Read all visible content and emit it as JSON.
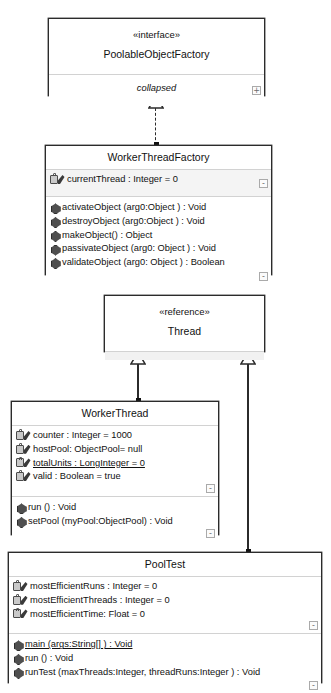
{
  "diagram": {
    "classes": [
      {
        "id": "poolable-object-factory",
        "stereotype": "«interface»",
        "name": "PoolableObjectFactory",
        "collapsed_label": "collapsed",
        "toggle": "+"
      },
      {
        "id": "worker-thread-factory",
        "name": "WorkerThreadFactory",
        "attributes": [
          "currentThread : Integer =  0"
        ],
        "attributes_toggle": "-",
        "operations": [
          "activateObject (arg0:Object  ) : Void",
          "destroyObject (arg0:Object  ) : Void",
          "makeObject() : Object",
          "passivateObject (arg0: Object  ) : Void",
          "validateObject (arg0: Object  ) : Boolean"
        ],
        "operations_toggle": "-"
      },
      {
        "id": "thread",
        "stereotype": "«reference»",
        "name": "Thread"
      },
      {
        "id": "worker-thread",
        "name": "WorkerThread",
        "attributes": [
          "counter : Integer =  1000",
          "hostPool: ObjectPool=  null",
          "totalUnits : LongInteger =  0",
          "valid : Boolean =  true"
        ],
        "attributes_static": [
          false,
          false,
          true,
          false
        ],
        "attributes_toggle": "-",
        "operations": [
          "run () : Void",
          "setPool (myPool:ObjectPool) : Void"
        ],
        "operations_static": [
          false,
          false
        ],
        "operations_toggle": "-"
      },
      {
        "id": "pool-test",
        "name": "PoolTest",
        "attributes": [
          "mostEfficientRuns : Integer =  0",
          "mostEfficientThreads : Integer =  0",
          "mostEfficientTime: Float =  0"
        ],
        "attributes_static": [
          false,
          false,
          false
        ],
        "attributes_toggle": "-",
        "operations": [
          "main (args:String[]  ) : Void",
          "run () : Void",
          "runTest (maxThreads:Integer, threadRuns:Integer ) : Void"
        ],
        "operations_static": [
          true,
          false,
          false
        ],
        "operations_toggle": "-"
      }
    ],
    "relationships": [
      {
        "name": "realization",
        "from": "WorkerThreadFactory",
        "to": "PoolableObjectFactory",
        "line": "dashed",
        "head": "hollow-triangle"
      },
      {
        "name": "generalization",
        "from": "WorkerThread",
        "to": "Thread",
        "line": "solid",
        "head": "hollow-triangle"
      },
      {
        "name": "generalization",
        "from": "PoolTest",
        "to": "Thread",
        "line": "solid",
        "head": "hollow-triangle"
      }
    ],
    "colors": {
      "border": "#2b2b2b",
      "background": "#ffffff",
      "compartment_divider": "#d2d2d2",
      "toggle_border": "#aaaaaa"
    }
  }
}
